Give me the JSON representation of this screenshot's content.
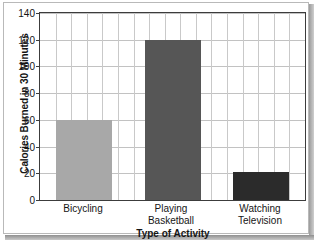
{
  "chart_data": {
    "type": "bar",
    "title": "",
    "subtitle": "",
    "xlabel": "Type of Activity",
    "ylabel": "Calories Burned in 30 Minutes",
    "categories": [
      "Bicycling",
      "Playing Basketball",
      "Watching Television"
    ],
    "category_lines": [
      [
        "Bicycling"
      ],
      [
        "Playing",
        "Basketball"
      ],
      [
        "Watching",
        "Television"
      ]
    ],
    "values": [
      60,
      120,
      21
    ],
    "bar_colors": [
      "#a8a8a8",
      "#565656",
      "#2b2b2b"
    ],
    "ylim": [
      0,
      140
    ],
    "ytick_step": 20,
    "yticks": [
      0,
      20,
      40,
      60,
      80,
      100,
      120,
      140
    ],
    "ytick_labels": [
      "0",
      "20",
      "40",
      "60",
      "80",
      "100",
      "120",
      "140"
    ],
    "grid": true,
    "grid_vertical_count": 17,
    "legend": null,
    "legend_position": "none",
    "annotations": []
  },
  "colors": {
    "grid_horizontal": "#c2c2c2",
    "grid_vertical": "#c9c9c9",
    "axis_frame": "#3c3c3c",
    "text": "#151515",
    "plot_background": "#ffffff",
    "page_background": "#ffffff",
    "page_border": "#b9b9b9"
  }
}
